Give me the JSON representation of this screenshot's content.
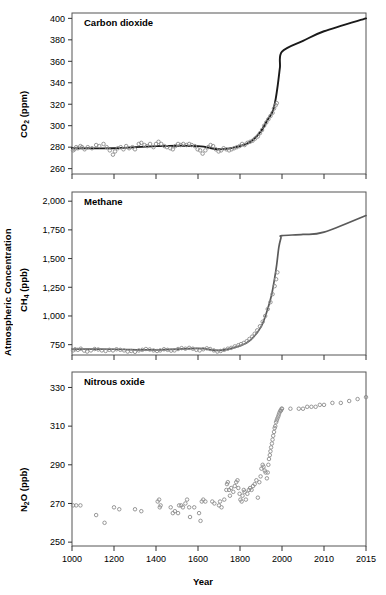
{
  "figure": {
    "y_axis_label": "Atmospheric Concentration",
    "x_axis_label": "Year"
  },
  "axis": {
    "x_ticks": [
      "1000",
      "1200",
      "1400",
      "1600",
      "1800",
      "2000",
      "2010",
      "2015"
    ],
    "x_tick_values": [
      1000,
      1200,
      1400,
      1600,
      1800,
      2000,
      2010,
      2015
    ]
  },
  "panels": [
    {
      "id": "co2",
      "title": "Carbon dioxide",
      "y_label_html": "CO<sub>2</sub> (ppm)",
      "y_ticks": [
        "400",
        "380",
        "360",
        "340",
        "320",
        "300",
        "280",
        "260"
      ],
      "marker_color": "#8c8c8c",
      "line_color": "#1a1a1a"
    },
    {
      "id": "ch4",
      "title": "Methane",
      "y_label_html": "CH<sub>4</sub> (ppb)",
      "y_ticks": [
        "2,000",
        "1,750",
        "1,500",
        "1,250",
        "1,000",
        "750"
      ],
      "marker_color": "#8c8c8c",
      "line_color": "#5a5a5a"
    },
    {
      "id": "n2o",
      "title": "Nitrous oxide",
      "y_label_html": "N<sub>2</sub>O (ppb)",
      "y_ticks": [
        "330",
        "310",
        "290",
        "270",
        "250"
      ],
      "marker_color": "#8c8c8c",
      "line_color": "none"
    }
  ],
  "chart_data": {
    "type": "scatter",
    "xlabel": "Year",
    "ylabel": "Atmospheric Concentration",
    "grid": false,
    "legend": "none",
    "x_axis_note": "Piecewise-linear year axis: equal pixel spacing for segments 1000-1200, 1200-1400, 1400-1600, 1600-1800, 1800-2000, 2000-2010, 2010-2015",
    "x_tick_labels": [
      "1000",
      "1200",
      "1400",
      "1600",
      "1800",
      "2000",
      "2010",
      "2015"
    ],
    "panels": [
      {
        "name": "Carbon dioxide",
        "series_label": "CO2 (ppm)",
        "ylim": [
          255,
          405
        ],
        "yticks": [
          260,
          280,
          300,
          320,
          340,
          360,
          380,
          400
        ],
        "has_fitted_line": true,
        "ice_core_points": [
          [
            1005,
            277
          ],
          [
            1012,
            278
          ],
          [
            1020,
            280
          ],
          [
            1028,
            279
          ],
          [
            1040,
            281
          ],
          [
            1048,
            280
          ],
          [
            1060,
            278
          ],
          [
            1075,
            280
          ],
          [
            1095,
            279
          ],
          [
            1115,
            282
          ],
          [
            1130,
            281
          ],
          [
            1150,
            283
          ],
          [
            1165,
            280
          ],
          [
            1180,
            277
          ],
          [
            1195,
            273
          ],
          [
            1205,
            276
          ],
          [
            1218,
            279
          ],
          [
            1232,
            280
          ],
          [
            1245,
            278
          ],
          [
            1258,
            281
          ],
          [
            1272,
            279
          ],
          [
            1288,
            280
          ],
          [
            1300,
            278
          ],
          [
            1318,
            283
          ],
          [
            1330,
            284
          ],
          [
            1345,
            282
          ],
          [
            1358,
            281
          ],
          [
            1372,
            283
          ],
          [
            1388,
            280
          ],
          [
            1400,
            283
          ],
          [
            1412,
            285
          ],
          [
            1425,
            283
          ],
          [
            1440,
            281
          ],
          [
            1452,
            280
          ],
          [
            1468,
            279
          ],
          [
            1480,
            278
          ],
          [
            1492,
            281
          ],
          [
            1505,
            283
          ],
          [
            1518,
            282
          ],
          [
            1530,
            283
          ],
          [
            1545,
            282
          ],
          [
            1558,
            283
          ],
          [
            1570,
            282
          ],
          [
            1585,
            281
          ],
          [
            1598,
            278
          ],
          [
            1610,
            277
          ],
          [
            1622,
            274
          ],
          [
            1635,
            277
          ],
          [
            1648,
            280
          ],
          [
            1660,
            282
          ],
          [
            1672,
            281
          ],
          [
            1685,
            278
          ],
          [
            1698,
            276
          ],
          [
            1710,
            277
          ],
          [
            1722,
            279
          ],
          [
            1735,
            278
          ],
          [
            1748,
            277
          ],
          [
            1760,
            278
          ],
          [
            1772,
            279
          ],
          [
            1785,
            280
          ],
          [
            1798,
            281
          ],
          [
            1810,
            283
          ],
          [
            1822,
            282
          ],
          [
            1835,
            284
          ],
          [
            1848,
            285
          ],
          [
            1860,
            286
          ],
          [
            1872,
            288
          ],
          [
            1885,
            290
          ],
          [
            1895,
            293
          ],
          [
            1905,
            296
          ],
          [
            1915,
            300
          ],
          [
            1925,
            303
          ],
          [
            1935,
            306
          ],
          [
            1945,
            309
          ],
          [
            1955,
            312
          ],
          [
            1962,
            316
          ],
          [
            1970,
            319
          ],
          [
            1975,
            321
          ]
        ],
        "fitted_line": [
          [
            1000,
            279
          ],
          [
            1200,
            279
          ],
          [
            1400,
            281
          ],
          [
            1600,
            281
          ],
          [
            1700,
            278
          ],
          [
            1800,
            281
          ],
          [
            1850,
            285
          ],
          [
            1900,
            295
          ],
          [
            1930,
            305
          ],
          [
            1950,
            311
          ],
          [
            1960,
            316
          ],
          [
            1970,
            325
          ],
          [
            1980,
            338
          ],
          [
            1990,
            354
          ],
          [
            2000,
            369
          ],
          [
            2005,
            379
          ],
          [
            2010,
            388
          ],
          [
            2015,
            400
          ]
        ],
        "recent_value": 400,
        "preindustrial_value": 280
      },
      {
        "name": "Methane",
        "series_label": "CH4 (ppb)",
        "ylim": [
          660,
          2080
        ],
        "yticks": [
          750,
          1000,
          1250,
          1500,
          1750,
          2000
        ],
        "has_fitted_line": true,
        "ice_core_points": [
          [
            1005,
            700
          ],
          [
            1015,
            710
          ],
          [
            1028,
            705
          ],
          [
            1042,
            715
          ],
          [
            1058,
            698
          ],
          [
            1072,
            690
          ],
          [
            1090,
            700
          ],
          [
            1108,
            712
          ],
          [
            1125,
            708
          ],
          [
            1142,
            700
          ],
          [
            1160,
            695
          ],
          [
            1178,
            705
          ],
          [
            1195,
            700
          ],
          [
            1212,
            710
          ],
          [
            1230,
            705
          ],
          [
            1248,
            700
          ],
          [
            1265,
            690
          ],
          [
            1282,
            695
          ],
          [
            1300,
            688
          ],
          [
            1318,
            700
          ],
          [
            1335,
            705
          ],
          [
            1352,
            712
          ],
          [
            1370,
            708
          ],
          [
            1388,
            700
          ],
          [
            1405,
            695
          ],
          [
            1420,
            700
          ],
          [
            1438,
            710
          ],
          [
            1455,
            705
          ],
          [
            1472,
            698
          ],
          [
            1488,
            700
          ],
          [
            1505,
            712
          ],
          [
            1522,
            720
          ],
          [
            1540,
            715
          ],
          [
            1558,
            722
          ],
          [
            1575,
            715
          ],
          [
            1592,
            705
          ],
          [
            1608,
            700
          ],
          [
            1625,
            710
          ],
          [
            1642,
            718
          ],
          [
            1658,
            712
          ],
          [
            1675,
            700
          ],
          [
            1692,
            690
          ],
          [
            1708,
            695
          ],
          [
            1725,
            705
          ],
          [
            1742,
            715
          ],
          [
            1758,
            722
          ],
          [
            1775,
            735
          ],
          [
            1792,
            745
          ],
          [
            1805,
            755
          ],
          [
            1818,
            765
          ],
          [
            1832,
            780
          ],
          [
            1845,
            800
          ],
          [
            1858,
            820
          ],
          [
            1870,
            845
          ],
          [
            1882,
            875
          ],
          [
            1895,
            910
          ],
          [
            1908,
            950
          ],
          [
            1920,
            1000
          ],
          [
            1932,
            1060
          ],
          [
            1945,
            1120
          ],
          [
            1955,
            1190
          ],
          [
            1965,
            1260
          ],
          [
            1972,
            1320
          ],
          [
            1978,
            1380
          ]
        ],
        "fitted_line": [
          [
            1000,
            712
          ],
          [
            1200,
            710
          ],
          [
            1400,
            705
          ],
          [
            1600,
            718
          ],
          [
            1700,
            700
          ],
          [
            1800,
            740
          ],
          [
            1850,
            790
          ],
          [
            1900,
            905
          ],
          [
            1930,
            1050
          ],
          [
            1950,
            1180
          ],
          [
            1965,
            1330
          ],
          [
            1975,
            1450
          ],
          [
            1985,
            1600
          ],
          [
            1995,
            1680
          ],
          [
            2000,
            1700
          ],
          [
            2005,
            1710
          ],
          [
            2010,
            1730
          ],
          [
            2015,
            1875
          ]
        ],
        "recent_value": 1875,
        "preindustrial_value": 722
      },
      {
        "name": "Nitrous oxide",
        "series_label": "N2O (ppb)",
        "ylim": [
          248,
          338
        ],
        "yticks": [
          250,
          270,
          290,
          310,
          330
        ],
        "has_fitted_line": false,
        "ice_core_points": [
          [
            1005,
            269
          ],
          [
            1020,
            269
          ],
          [
            1040,
            269
          ],
          [
            1115,
            264
          ],
          [
            1155,
            260
          ],
          [
            1200,
            268
          ],
          [
            1225,
            267
          ],
          [
            1300,
            267
          ],
          [
            1330,
            266
          ],
          [
            1408,
            271
          ],
          [
            1415,
            272
          ],
          [
            1418,
            268
          ],
          [
            1422,
            269
          ],
          [
            1470,
            268
          ],
          [
            1480,
            265
          ],
          [
            1490,
            266
          ],
          [
            1505,
            265
          ],
          [
            1510,
            269
          ],
          [
            1520,
            269
          ],
          [
            1528,
            268
          ],
          [
            1540,
            270
          ],
          [
            1548,
            272
          ],
          [
            1558,
            268
          ],
          [
            1562,
            263
          ],
          [
            1582,
            268
          ],
          [
            1605,
            265
          ],
          [
            1612,
            261
          ],
          [
            1618,
            271
          ],
          [
            1625,
            272
          ],
          [
            1635,
            271
          ],
          [
            1668,
            271
          ],
          [
            1678,
            270
          ],
          [
            1700,
            269
          ],
          [
            1705,
            271
          ],
          [
            1712,
            268
          ],
          [
            1725,
            272
          ],
          [
            1735,
            277
          ],
          [
            1738,
            280
          ],
          [
            1742,
            281
          ],
          [
            1748,
            277
          ],
          [
            1752,
            274
          ],
          [
            1758,
            278
          ],
          [
            1768,
            276
          ],
          [
            1775,
            279
          ],
          [
            1782,
            281
          ],
          [
            1788,
            282
          ],
          [
            1792,
            278
          ],
          [
            1798,
            275
          ],
          [
            1802,
            272
          ],
          [
            1808,
            271
          ],
          [
            1812,
            274
          ],
          [
            1818,
            277
          ],
          [
            1822,
            276
          ],
          [
            1828,
            272
          ],
          [
            1835,
            275
          ],
          [
            1842,
            277
          ],
          [
            1848,
            278
          ],
          [
            1855,
            277
          ],
          [
            1862,
            279
          ],
          [
            1870,
            280
          ],
          [
            1878,
            282
          ],
          [
            1885,
            273
          ],
          [
            1892,
            281
          ],
          [
            1898,
            284
          ],
          [
            1902,
            288
          ],
          [
            1908,
            290
          ],
          [
            1912,
            289
          ],
          [
            1918,
            287
          ],
          [
            1922,
            286
          ],
          [
            1928,
            283
          ],
          [
            1932,
            286
          ],
          [
            1935,
            290
          ],
          [
            1938,
            293
          ],
          [
            1942,
            295
          ],
          [
            1945,
            297
          ],
          [
            1948,
            299
          ],
          [
            1952,
            301
          ],
          [
            1955,
            303
          ],
          [
            1958,
            305
          ],
          [
            1962,
            307
          ],
          [
            1965,
            309
          ],
          [
            1968,
            310
          ],
          [
            1972,
            312
          ],
          [
            1975,
            313
          ],
          [
            1978,
            314
          ],
          [
            1982,
            315
          ],
          [
            1985,
            316
          ],
          [
            1988,
            317
          ],
          [
            1992,
            318
          ],
          [
            1995,
            318
          ],
          [
            1998,
            319
          ],
          [
            2000,
            319
          ],
          [
            2002,
            319
          ],
          [
            2004,
            319
          ],
          [
            2005,
            319
          ],
          [
            2006,
            320
          ],
          [
            2007,
            320
          ],
          [
            2008,
            320
          ],
          [
            2009,
            321
          ],
          [
            2010,
            321
          ],
          [
            2011,
            322
          ],
          [
            2012,
            322
          ],
          [
            2013,
            323
          ],
          [
            2014,
            324
          ],
          [
            2015,
            325
          ]
        ],
        "recent_value": 325,
        "preindustrial_value": 270
      }
    ]
  }
}
